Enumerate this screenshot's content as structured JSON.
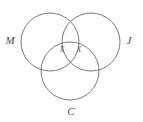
{
  "figure": {
    "type": "venn-diagram-3-set",
    "background_color": "#ffffff",
    "stroke_color": "#6b6b6b",
    "label_color": "#4a4a4a",
    "mark_color": "#5a5a5a"
  },
  "sets": [
    {
      "id": "m",
      "label": "M",
      "position": "upper-left",
      "cx": 50,
      "cy": 42,
      "r": 29,
      "label_x": 10,
      "label_y": 41
    },
    {
      "id": "j",
      "label": "J",
      "position": "upper-right",
      "cx": 91,
      "cy": 42,
      "r": 29,
      "label_x": 129,
      "label_y": 41
    },
    {
      "id": "c",
      "label": "C",
      "position": "bottom",
      "cx": 70,
      "cy": 71,
      "r": 29,
      "label_x": 71,
      "label_y": 112
    }
  ],
  "marks": [
    {
      "id": "mark-left",
      "text": "X",
      "x": 62,
      "y": 50,
      "region": "M and J and C"
    },
    {
      "id": "mark-right",
      "text": "X",
      "x": 79,
      "y": 50,
      "region": "M and J and C"
    }
  ]
}
